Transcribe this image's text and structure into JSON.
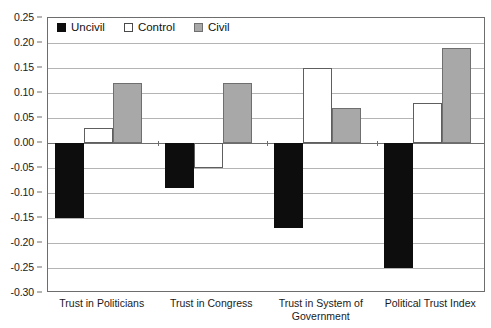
{
  "chart_data": {
    "type": "bar",
    "title": "",
    "xlabel": "",
    "ylabel": "",
    "ylim": [
      -0.3,
      0.25
    ],
    "ytick_step": 0.05,
    "grid": true,
    "legend_position": "top-left-inside",
    "categories": [
      "Trust in Politicians",
      "Trust in Congress",
      "Trust in System of Government",
      "Political Trust Index"
    ],
    "ytick_labels": [
      "0.25",
      "0.20",
      "0.15",
      "0.10",
      "0.05",
      "0.00",
      "-0.05",
      "-0.10",
      "-0.15",
      "-0.20",
      "-0.25",
      "-0.30"
    ],
    "ytick_values": [
      0.25,
      0.2,
      0.15,
      0.1,
      0.05,
      0.0,
      -0.05,
      -0.1,
      -0.15,
      -0.2,
      -0.25,
      -0.3
    ],
    "series": [
      {
        "name": "Uncivil",
        "color": "#0d0d0d",
        "values": [
          -0.15,
          -0.09,
          -0.17,
          -0.25
        ]
      },
      {
        "name": "Control",
        "color": "#ffffff",
        "values": [
          0.03,
          -0.05,
          0.15,
          0.08
        ]
      },
      {
        "name": "Civil",
        "color": "#a8a8a8",
        "values": [
          0.12,
          0.12,
          0.07,
          0.19
        ]
      }
    ]
  },
  "legend": {
    "items": [
      {
        "label": "Uncivil",
        "swatch": "black-filled-square"
      },
      {
        "label": "Control",
        "swatch": "white-outlined-square"
      },
      {
        "label": "Civil",
        "swatch": "gray-filled-square"
      }
    ]
  },
  "colors": {
    "uncivil": "#0d0d0d",
    "control": "#ffffff",
    "civil": "#a8a8a8",
    "gridline": "#b4b4b4",
    "axis": "#6d6d6d",
    "text": "#1a1a1a",
    "background": "#ffffff"
  }
}
